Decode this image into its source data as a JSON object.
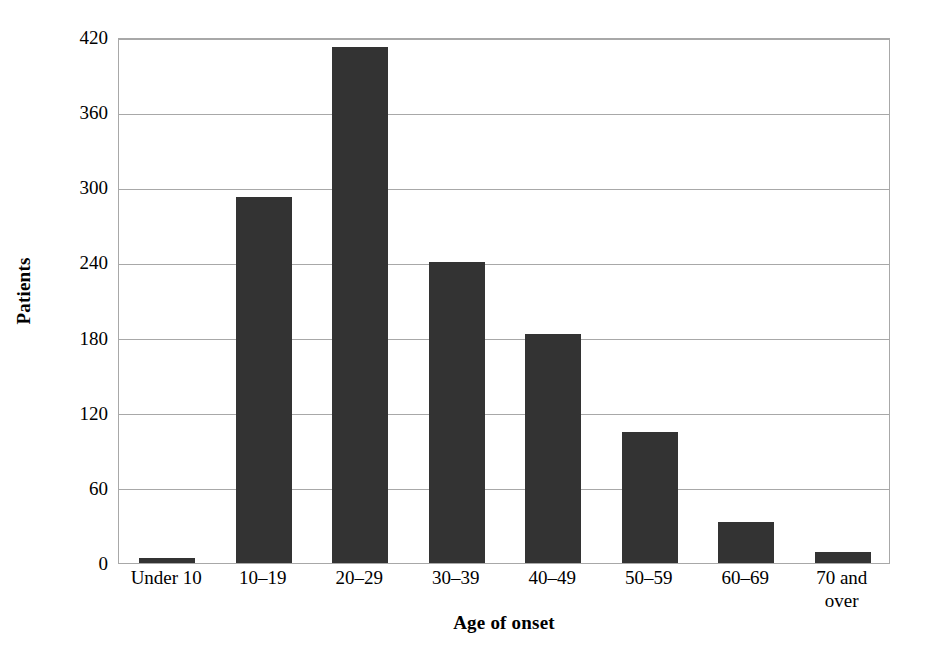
{
  "chart_data": {
    "type": "bar",
    "title": "",
    "subtitle": "",
    "xlabel": "Age of onset",
    "ylabel": "Patients",
    "categories": [
      "Under 10",
      "10–19",
      "20–29",
      "30–39",
      "40–49",
      "50–59",
      "60–69",
      "70 and\nover"
    ],
    "values": [
      4,
      292,
      412,
      240,
      183,
      105,
      33,
      9
    ],
    "ylim": [
      0,
      420
    ],
    "yticks": [
      0,
      60,
      120,
      180,
      240,
      300,
      360,
      420
    ],
    "ytick_labels": [
      "0",
      "60",
      "120",
      "180",
      "240",
      "300",
      "360",
      "420"
    ],
    "grid": "horizontal",
    "legend": "none",
    "bar_color": "#333333",
    "grid_color": "#a8a8a8",
    "axis_color": "#a8a8a8",
    "background": "#ffffff"
  }
}
